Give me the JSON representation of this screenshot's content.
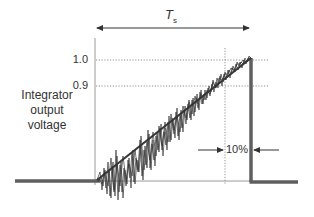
{
  "diagram": {
    "y_axis_label_lines": [
      "Integrator",
      "output",
      "voltage"
    ],
    "y_ticks": [
      {
        "label": "1.0",
        "value": 1.0
      },
      {
        "label": "0.9",
        "value": 0.9
      }
    ],
    "period_label": "T",
    "period_subscript": "s",
    "tolerance_label": "10%",
    "colors": {
      "axis": "#9a9a9a",
      "thick_line": "#5f5f5f",
      "signal": "#333333",
      "text": "#333333"
    }
  }
}
